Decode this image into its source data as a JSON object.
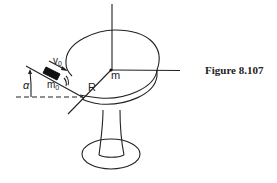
{
  "figure": {
    "caption": "Figure 8.107",
    "labels": {
      "center_mass": "m",
      "radius": "R",
      "velocity": "v",
      "velocity_sub": "0",
      "projectile_mass": "m",
      "projectile_mass_sub": "0",
      "angle": "α"
    },
    "colors": {
      "stroke": "#222222",
      "background": "#ffffff"
    }
  }
}
